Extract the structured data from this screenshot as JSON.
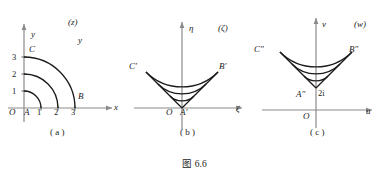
{
  "figure": {
    "caption": "图 6.6",
    "background_color": "#ffffff",
    "curve_color": "#1a1a1a",
    "axis_color": "#8a8a8a"
  },
  "panels": [
    {
      "id": "a",
      "sub_caption": "( a )",
      "plane_label": "(z)",
      "axes": {
        "x_label": "x",
        "y_label": "y",
        "origin_label": "O"
      },
      "x_ticks": [
        "1",
        "2",
        "3"
      ],
      "y_ticks": [
        "1",
        "2",
        "3"
      ],
      "point_labels": [
        "A",
        "B",
        "C"
      ],
      "shape": {
        "type": "quarter-annulus-arcs",
        "radii": [
          1,
          2,
          3
        ],
        "angle_start_deg": 0,
        "angle_end_deg": 90
      }
    },
    {
      "id": "b",
      "sub_caption": "( b )",
      "plane_label": "(ζ)",
      "axes": {
        "x_label": "ζ",
        "y_label": "η",
        "origin_label": "O"
      },
      "x_ticks": [],
      "y_ticks": [],
      "point_labels": [
        "A′",
        "B′",
        "C′"
      ],
      "shape": {
        "type": "sector-arcs",
        "radii": [
          1,
          2,
          3
        ],
        "angle_start_deg": 45,
        "angle_end_deg": 135,
        "apex": "origin"
      }
    },
    {
      "id": "c",
      "sub_caption": "( c )",
      "plane_label": "(w)",
      "axes": {
        "x_label": "u",
        "y_label": "v",
        "origin_label": "O"
      },
      "x_ticks": [],
      "y_ticks": [],
      "point_labels": [
        "A″",
        "B″",
        "C″"
      ],
      "marker_label": "2i",
      "shape": {
        "type": "sector-arcs",
        "radii": [
          1,
          2,
          3
        ],
        "angle_start_deg": 45,
        "angle_end_deg": 135,
        "apex": "2i"
      }
    }
  ]
}
